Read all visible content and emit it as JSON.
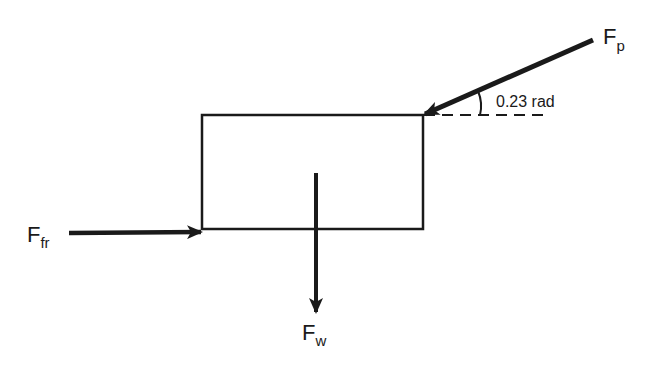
{
  "diagram": {
    "type": "free-body diagram",
    "colors": {
      "ink": "#1a1a1a",
      "background": "#ffffff"
    },
    "object": {
      "shape": "rectangle",
      "label": ""
    },
    "forces": [
      {
        "id": "push",
        "symbol": "F",
        "subscript": "p",
        "direction": "down-left into top-right corner",
        "angle_label": "0.23 rad"
      },
      {
        "id": "friction",
        "symbol": "F",
        "subscript": "fr",
        "direction": "right, into bottom-left corner"
      },
      {
        "id": "weight",
        "symbol": "F",
        "subscript": "w",
        "direction": "down"
      }
    ],
    "angle": {
      "label": "0.23 rad",
      "reference": "horizontal dashed line"
    }
  }
}
